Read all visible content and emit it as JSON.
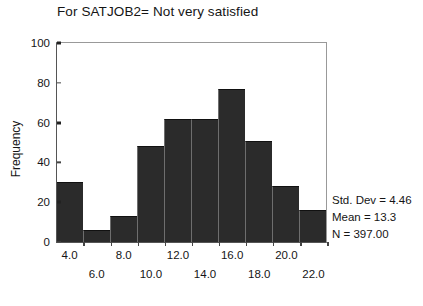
{
  "chart_data": {
    "type": "bar",
    "title": "For SATJOB2= Not very satisfied",
    "xlabel": "",
    "ylabel": "Frequency",
    "ylim": [
      0,
      100
    ],
    "xlim": [
      3.0,
      23.0
    ],
    "grid": false,
    "legend": "none",
    "bin_width": 2,
    "categories": [
      "4.0",
      "6.0",
      "8.0",
      "10.0",
      "12.0",
      "14.0",
      "16.0",
      "18.0",
      "20.0",
      "22.0"
    ],
    "values": [
      30,
      6,
      13,
      48,
      62,
      62,
      77,
      51,
      28,
      16
    ],
    "bar_color": "#2b2b2b",
    "y_ticks": [
      {
        "value": 100,
        "label": "100",
        "major": true
      },
      {
        "value": 80,
        "label": "80",
        "major": false
      },
      {
        "value": 60,
        "label": "60",
        "major": true
      },
      {
        "value": 40,
        "label": "40",
        "major": false
      },
      {
        "value": 20,
        "label": "20",
        "major": true
      },
      {
        "value": 0,
        "label": "0",
        "major": false
      }
    ],
    "x_ticks": [
      {
        "label": "4.0",
        "row": "upper"
      },
      {
        "label": "6.0",
        "row": "lower"
      },
      {
        "label": "8.0",
        "row": "upper"
      },
      {
        "label": "10.0",
        "row": "lower"
      },
      {
        "label": "12.0",
        "row": "upper"
      },
      {
        "label": "14.0",
        "row": "lower"
      },
      {
        "label": "16.0",
        "row": "upper"
      },
      {
        "label": "18.0",
        "row": "lower"
      },
      {
        "label": "20.0",
        "row": "upper"
      },
      {
        "label": "22.0",
        "row": "lower"
      }
    ],
    "annotations": {
      "std_dev": "Std. Dev = 4.46",
      "mean": "Mean = 13.3",
      "n": "N = 397.00"
    }
  }
}
